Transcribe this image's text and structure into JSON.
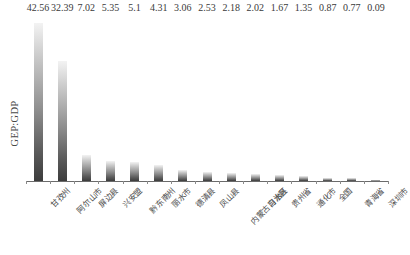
{
  "chart_data": {
    "type": "bar",
    "title": "",
    "xlabel": "",
    "ylabel": "GEP:GDP",
    "ylim": [
      0,
      45
    ],
    "grid": false,
    "legend": "none",
    "categories": [
      "甘孜州",
      "阿尔山市",
      "屏边县",
      "兴安盟",
      "黔东南州",
      "丽水市",
      "德清县",
      "凤山县",
      "内蒙古自治区",
      "习水县",
      "贵州省",
      "通化市",
      "全国",
      "青海省",
      "深圳市"
    ],
    "values": [
      42.56,
      32.39,
      7.02,
      5.35,
      5.1,
      4.31,
      3.06,
      2.53,
      2.18,
      2.02,
      1.67,
      1.35,
      0.87,
      0.77,
      0.09
    ],
    "value_labels": [
      "42.56",
      "32.39",
      "7.02",
      "5.35",
      "5.1",
      "4.31",
      "3.06",
      "2.53",
      "2.18",
      "2.02",
      "1.67",
      "1.35",
      "0.87",
      "0.77",
      "0.09"
    ],
    "bar_fill": "#8e8e8e",
    "axis_color": "#6b6b6b",
    "text_color": "#3a3a3a"
  }
}
